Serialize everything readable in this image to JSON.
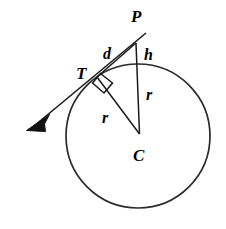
{
  "figure": {
    "background_color": "#ffffff",
    "stroke_color": "#1a1a1a",
    "width": 226,
    "height": 229
  },
  "circle": {
    "name": "circle-C",
    "center_x": 138,
    "center_y": 136,
    "radius": 72,
    "stroke_color": "#2b2b2b",
    "stroke_width": 1.7,
    "fill": "none"
  },
  "points": {
    "P": {
      "label": "P",
      "x": 136,
      "y": 40,
      "label_x": 131,
      "label_y": 21,
      "description": "external point above circle"
    },
    "T": {
      "label": "T",
      "x": 97,
      "y": 77,
      "label_x": 76,
      "label_y": 78,
      "description": "point of tangency on circle"
    },
    "C": {
      "label": "C",
      "x": 138,
      "y": 136,
      "label_x": 133,
      "label_y": 159,
      "description": "center of circle"
    }
  },
  "segments": [
    {
      "name": "segment-d-PT",
      "label": "d",
      "from": "P",
      "to": "T",
      "label_x": 104,
      "label_y": 58,
      "description": "tangent length from P to T"
    },
    {
      "name": "segment-h-PQ",
      "label": "h",
      "from": "P",
      "to": "circle-top",
      "label_x": 145,
      "label_y": 59,
      "description": "external distance from P to circle along line PC"
    },
    {
      "name": "segment-r-PC",
      "label": "r",
      "from": "circle-top",
      "to": "C",
      "label_x": 147,
      "label_y": 99,
      "description": "radius along vertical line to center"
    },
    {
      "name": "segment-r-TC",
      "label": "r",
      "from": "T",
      "to": "C",
      "label_x": 103,
      "label_y": 122,
      "description": "radius to point of tangency"
    }
  ],
  "tangent_ray": {
    "name": "tangent-ray",
    "start_x": 144,
    "start_y": 34,
    "end_x": 30,
    "end_y": 128,
    "arrow_tip_x": 27,
    "arrow_tip_y": 130,
    "description": "tangent line through T extended with arrowhead toward lower-left"
  },
  "right_angle": {
    "name": "right-angle-marker",
    "vertex_x": 97,
    "vertex_y": 77,
    "size": 15,
    "description": "square mark showing tangent is perpendicular to radius at T"
  },
  "icons": {
    "arrow_head": "arrow-head-icon",
    "right_angle": "right-angle-icon"
  }
}
